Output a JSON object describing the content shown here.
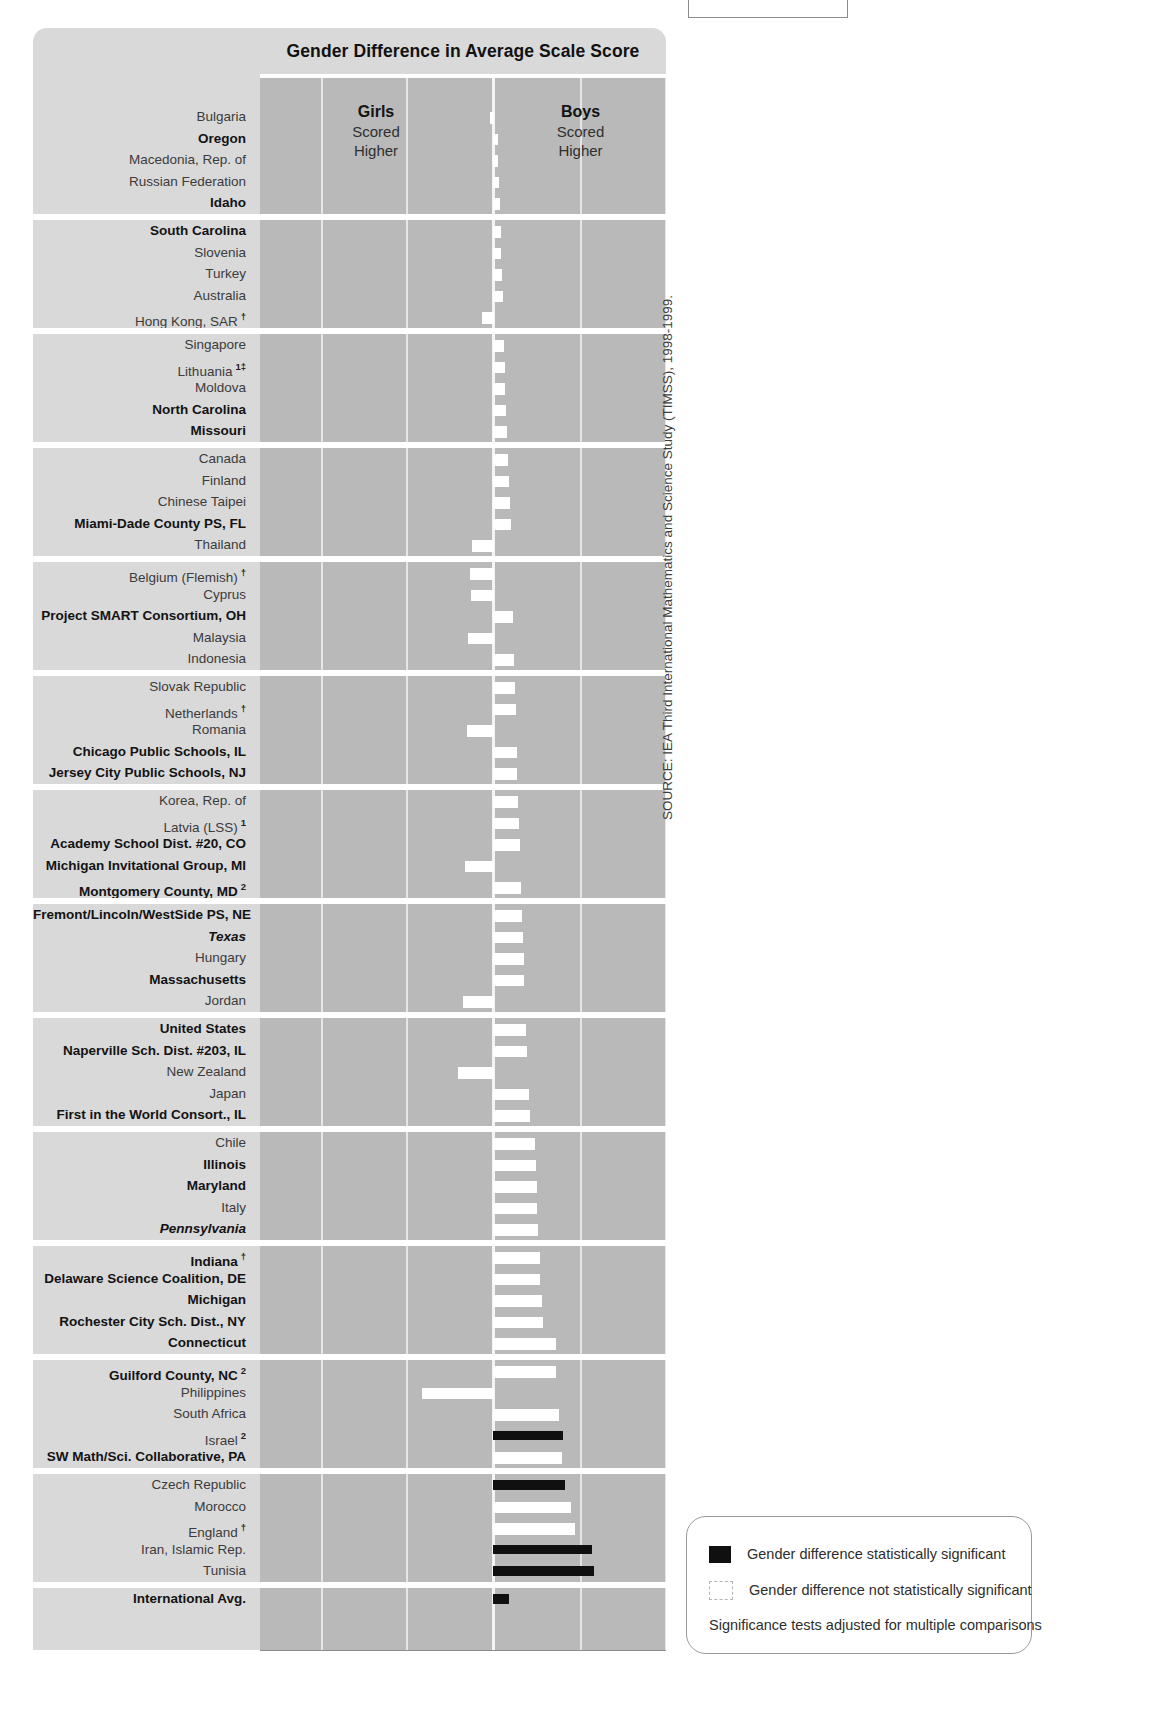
{
  "header": {
    "title": "Gender Difference in Average Scale Score",
    "left_side_label": "Girls",
    "left_side_sub1": "Scored",
    "left_side_sub2": "Higher",
    "right_side_label": "Boys",
    "right_side_sub1": "Scored",
    "right_side_sub2": "Higher"
  },
  "axis": {
    "ticks": [
      "40",
      "20",
      "0",
      "20",
      "40"
    ],
    "tick_values": [
      -40,
      -20,
      0,
      20,
      40
    ]
  },
  "source": "SOURCE: IEA Third International Mathematics and Science Study (TIMSS), 1998-1999.",
  "legend": {
    "significant_label": "Gender difference statistically significant",
    "not_significant_label": "Gender difference not statistically significant",
    "note": "Significance tests adjusted for multiple comparisons",
    "significant_color": "#101010",
    "not_significant_color": "#ffffff"
  },
  "chart_data": {
    "type": "bar",
    "orientation": "horizontal-diverging",
    "title": "Gender Difference in Average Scale Score",
    "xlabel": "",
    "ylabel": "",
    "xlim": [
      -40,
      40
    ],
    "grid": true,
    "legend_position": "bottom-right",
    "value_meaning": "Positive = Boys scored higher; Negative = Girls scored higher (scale score points)",
    "series_name": "Gender difference (Boys minus Girls)",
    "categories": [
      "Bulgaria",
      "Oregon",
      "Macedonia, Rep. of",
      "Russian Federation",
      "Idaho",
      "South Carolina",
      "Slovenia",
      "Turkey",
      "Australia",
      "Hong Kong, SAR",
      "Singapore",
      "Lithuania",
      "Moldova",
      "North Carolina",
      "Missouri",
      "Canada",
      "Finland",
      "Chinese Taipei",
      "Miami-Dade County PS, FL",
      "Thailand",
      "Belgium (Flemish)",
      "Cyprus",
      "Project SMART Consortium, OH",
      "Malaysia",
      "Indonesia",
      "Slovak Republic",
      "Netherlands",
      "Romania",
      "Chicago Public Schools, IL",
      "Jersey City Public Schools, NJ",
      "Korea, Rep. of",
      "Latvia (LSS)",
      "Academy School Dist. #20, CO",
      "Michigan Invitational Group, MI",
      "Montgomery County, MD",
      "Fremont/Lincoln/WestSide PS, NE",
      "Texas",
      "Hungary",
      "Massachusetts",
      "Jordan",
      "United States",
      "Naperville Sch. Dist. #203, IL",
      "New Zealand",
      "Japan",
      "First in the World Consort., IL",
      "Chile",
      "Illinois",
      "Maryland",
      "Italy",
      "Pennsylvania",
      "Indiana",
      "Delaware Science Coalition, DE",
      "Michigan",
      "Rochester City Sch. Dist., NY",
      "Connecticut",
      "Guilford County, NC",
      "Philippines",
      "South Africa",
      "Israel",
      "SW Math/Sci. Collaborative, PA",
      "Czech Republic",
      "Morocco",
      "England",
      "Iran, Islamic Rep.",
      "Tunisia",
      "International Avg."
    ],
    "values": [
      -0.4,
      0.6,
      0.8,
      1.0,
      1.2,
      1.4,
      1.5,
      1.6,
      1.8,
      -2.4,
      2.0,
      2.2,
      2.4,
      2.6,
      2.8,
      3.0,
      3.2,
      3.4,
      3.6,
      -4.6,
      -5.2,
      -4.8,
      4.2,
      -5.6,
      4.4,
      4.6,
      4.8,
      -5.8,
      5.0,
      5.2,
      5.4,
      5.6,
      5.8,
      -6.2,
      6.0,
      6.2,
      6.4,
      6.6,
      6.8,
      -6.8,
      7.2,
      7.4,
      -7.8,
      7.8,
      8.0,
      9.2,
      9.4,
      9.6,
      9.8,
      10.0,
      10.4,
      10.4,
      10.8,
      11.2,
      14.0,
      14.2,
      -16.2,
      14.8,
      16.2,
      15.6,
      16.6,
      17.6,
      18.6,
      22.8,
      23.4,
      3.6
    ],
    "significance": [
      "ns",
      "ns",
      "ns",
      "ns",
      "ns",
      "ns",
      "ns",
      "ns",
      "ns",
      "ns",
      "ns",
      "ns",
      "ns",
      "ns",
      "ns",
      "ns",
      "ns",
      "ns",
      "ns",
      "ns",
      "ns",
      "ns",
      "ns",
      "ns",
      "ns",
      "ns",
      "ns",
      "ns",
      "ns",
      "ns",
      "ns",
      "ns",
      "ns",
      "ns",
      "ns",
      "ns",
      "ns",
      "ns",
      "ns",
      "ns",
      "ns",
      "ns",
      "ns",
      "ns",
      "ns",
      "ns",
      "ns",
      "ns",
      "ns",
      "ns",
      "ns",
      "ns",
      "ns",
      "ns",
      "ns",
      "ns",
      "ns",
      "ns",
      "sig",
      "ns",
      "sig",
      "ns",
      "ns",
      "sig",
      "sig",
      "sig"
    ],
    "label_styles": [
      "normal",
      "bold",
      "normal",
      "normal",
      "bold",
      "bold",
      "normal",
      "normal",
      "normal",
      "normal",
      "normal",
      "normal",
      "normal",
      "bold",
      "bold",
      "normal",
      "normal",
      "normal",
      "bold",
      "normal",
      "normal",
      "normal",
      "bold",
      "normal",
      "normal",
      "normal",
      "normal",
      "normal",
      "bold",
      "bold",
      "normal",
      "normal",
      "bold",
      "bold",
      "bold",
      "bold",
      "italic",
      "normal",
      "bold",
      "normal",
      "bold",
      "bold",
      "normal",
      "normal",
      "bold",
      "normal",
      "bold",
      "bold",
      "normal",
      "italic",
      "bold",
      "bold",
      "bold",
      "bold",
      "bold",
      "bold",
      "normal",
      "normal",
      "normal",
      "bold",
      "normal",
      "normal",
      "normal",
      "normal",
      "normal",
      "bold"
    ],
    "footnote_marks": [
      "",
      "",
      "",
      "",
      "",
      "",
      "",
      "",
      "",
      "†",
      "",
      "1‡",
      "",
      "",
      "",
      "",
      "",
      "",
      "",
      "",
      "†",
      "",
      "",
      "",
      "",
      "",
      "†",
      "",
      "",
      "",
      "",
      "1",
      "",
      "",
      "2",
      "",
      "",
      "",
      "",
      "",
      "",
      "",
      "",
      "",
      "",
      "",
      "",
      "",
      "",
      "",
      "†",
      "",
      "",
      "",
      "",
      "2",
      "",
      "",
      "2",
      "",
      "",
      "",
      "†",
      "",
      "",
      ""
    ],
    "group_breaks": [
      5,
      10,
      15,
      20,
      25,
      30,
      35,
      40,
      45,
      50,
      55,
      60,
      65
    ]
  }
}
